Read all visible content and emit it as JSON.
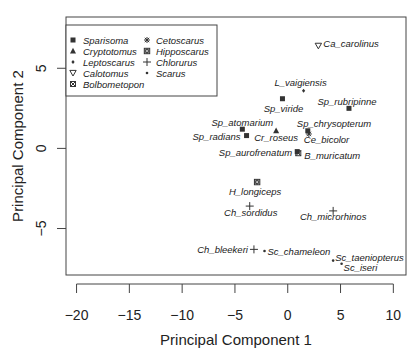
{
  "chart_data": {
    "type": "scatter",
    "title": "",
    "xlabel": "Principal Component 1",
    "ylabel": "Principal Component 2",
    "xlim": [
      -21,
      11.2
    ],
    "ylim": [
      -7.9,
      8.2
    ],
    "xticks": [
      -20,
      -15,
      -10,
      -5,
      0,
      5,
      10
    ],
    "yticks": [
      -5,
      0,
      5
    ],
    "grid": false,
    "legend_position": "topleft",
    "legend": [
      {
        "genus": "Sparisoma",
        "symbol": "filled-square"
      },
      {
        "genus": "Cryptotomus",
        "symbol": "filled-triangle"
      },
      {
        "genus": "Leptoscarus",
        "symbol": "small-diamond"
      },
      {
        "genus": "Calotomus",
        "symbol": "open-triangle-down"
      },
      {
        "genus": "Bolbometopon",
        "symbol": "boxed-x-square"
      },
      {
        "genus": "Cetoscarus",
        "symbol": "asterisk"
      },
      {
        "genus": "Hipposcarus",
        "symbol": "star-square"
      },
      {
        "genus": "Chlorurus",
        "symbol": "plus"
      },
      {
        "genus": "Scarus",
        "symbol": "dot"
      }
    ],
    "points": [
      {
        "label": "Ca_carolinus",
        "genus": "Calotomus",
        "x": 2.9,
        "y": 6.4,
        "ldx": 5,
        "ldy": 1,
        "anchor": "start"
      },
      {
        "label": "L_vaigiensis",
        "genus": "Leptoscarus",
        "x": 1.5,
        "y": 3.6,
        "ldx": -3,
        "ldy": -5,
        "anchor": "middle"
      },
      {
        "label": "Sp_viride",
        "genus": "Sparisoma",
        "x": -0.5,
        "y": 3.1,
        "ldx": 1,
        "ldy": 13,
        "anchor": "middle"
      },
      {
        "label": "Sp_rubripinne",
        "genus": "Sparisoma",
        "x": 5.8,
        "y": 2.5,
        "ldx": -2,
        "ldy": -3,
        "anchor": "middle"
      },
      {
        "label": "Sp_atomarium",
        "genus": "Sparisoma",
        "x": -4.3,
        "y": 1.2,
        "ldx": 0,
        "ldy": -3,
        "anchor": "middle"
      },
      {
        "label": "Sp_radians",
        "genus": "Sparisoma",
        "x": -3.9,
        "y": 0.8,
        "ldx": -6,
        "ldy": 4,
        "anchor": "end"
      },
      {
        "label": "Cr_roseus",
        "genus": "Cryptotomus",
        "x": -1.1,
        "y": 1.1,
        "ldx": 0,
        "ldy": 10,
        "anchor": "middle"
      },
      {
        "label": "Sp_chrysopterum",
        "genus": "Sparisoma",
        "x": 1.9,
        "y": 1.1,
        "ldx": -11,
        "ldy": -4,
        "anchor": "start"
      },
      {
        "label": "Ce_bicolor",
        "genus": "Cetoscarus",
        "x": 2.0,
        "y": 0.9,
        "ldx": -5,
        "ldy": 9,
        "anchor": "start"
      },
      {
        "label": "Sp_aurofrenatum",
        "genus": "Sparisoma",
        "x": 0.9,
        "y": -0.2,
        "ldx": -5,
        "ldy": 4,
        "anchor": "end"
      },
      {
        "label": "B_muricatum",
        "genus": "Bolbometopon",
        "x": 1.0,
        "y": -0.3,
        "ldx": 6,
        "ldy": 6,
        "anchor": "start"
      },
      {
        "label": "H_longiceps",
        "genus": "Hipposcarus",
        "x": -2.9,
        "y": -2.1,
        "ldx": -2,
        "ldy": 13,
        "anchor": "middle"
      },
      {
        "label": "Ch_sordidus",
        "genus": "Chlorurus",
        "x": -3.6,
        "y": -3.6,
        "ldx": 1,
        "ldy": 10,
        "anchor": "middle"
      },
      {
        "label": "Ch_microrhinos",
        "genus": "Chlorurus",
        "x": 4.3,
        "y": -3.9,
        "ldx": 0,
        "ldy": 9,
        "anchor": "middle"
      },
      {
        "label": "Ch_bleekeri",
        "genus": "Chlorurus",
        "x": -3.2,
        "y": -6.3,
        "ldx": -6,
        "ldy": 4,
        "anchor": "end"
      },
      {
        "label": "Sc_chameleon",
        "genus": "Scarus",
        "x": -2.2,
        "y": -6.4,
        "ldx": 3,
        "ldy": 4,
        "anchor": "start"
      },
      {
        "label": "Sc_taeniopterus",
        "genus": "Scarus",
        "x": 4.3,
        "y": -7.0,
        "ldx": 2,
        "ldy": 0,
        "anchor": "start"
      },
      {
        "label": "Sc_iseri",
        "genus": "Scarus",
        "x": 5.1,
        "y": -7.2,
        "ldx": 2,
        "ldy": 7,
        "anchor": "start"
      }
    ],
    "colors": {
      "marker": "#333333",
      "text": "#222222",
      "frame": "#444444",
      "background": "#ffffff"
    }
  }
}
